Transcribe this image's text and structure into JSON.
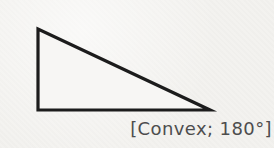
{
  "figure": {
    "type": "geometry-diagram",
    "shape": "right triangle (vertical left side, horizontal base, long hypotenuse)",
    "caption": "[Convex; 180°]",
    "triangle": {
      "points": "38,29 38,110 210,110",
      "stroke": "#1c1c1c",
      "stroke_width": 3.2,
      "fill": "#f7f6f4"
    },
    "colors": {
      "background": "#f3f2ef",
      "caption_text": "#4d4d4d"
    }
  }
}
